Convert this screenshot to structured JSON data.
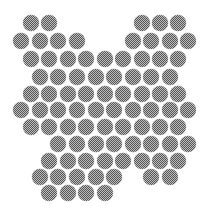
{
  "figure": {
    "dot_diameter": 16,
    "colors": {
      "dark": "#5a5a5a",
      "light": "#b9b9b9",
      "background": "#ffffff"
    },
    "rows": [
      {
        "y": 23,
        "x": [
          31,
          49,
          142,
          160,
          178
        ]
      },
      {
        "y": 41,
        "x": [
          21,
          40,
          58,
          77,
          133,
          151,
          170,
          188
        ]
      },
      {
        "y": 59,
        "x": [
          31,
          49,
          68,
          86,
          105,
          123,
          142,
          160,
          178
        ]
      },
      {
        "y": 77,
        "x": [
          40,
          58,
          77,
          96,
          114,
          133,
          151,
          170
        ]
      },
      {
        "y": 94,
        "x": [
          31,
          49,
          68,
          86,
          105,
          123,
          142,
          160,
          178
        ]
      },
      {
        "y": 110,
        "x": [
          21,
          40,
          58,
          77,
          96,
          114,
          133,
          151,
          170,
          188
        ]
      },
      {
        "y": 127,
        "x": [
          31,
          49,
          68,
          86,
          105,
          123,
          142,
          160,
          178
        ]
      },
      {
        "y": 144,
        "x": [
          58,
          77,
          96,
          114,
          133,
          151,
          170,
          188
        ]
      },
      {
        "y": 161,
        "x": [
          49,
          68,
          86,
          105,
          123,
          142,
          160,
          178
        ]
      },
      {
        "y": 177,
        "x": [
          40,
          58,
          77,
          96,
          114,
          151,
          170
        ]
      },
      {
        "y": 193,
        "x": [
          49,
          68,
          86,
          105
        ]
      }
    ]
  }
}
